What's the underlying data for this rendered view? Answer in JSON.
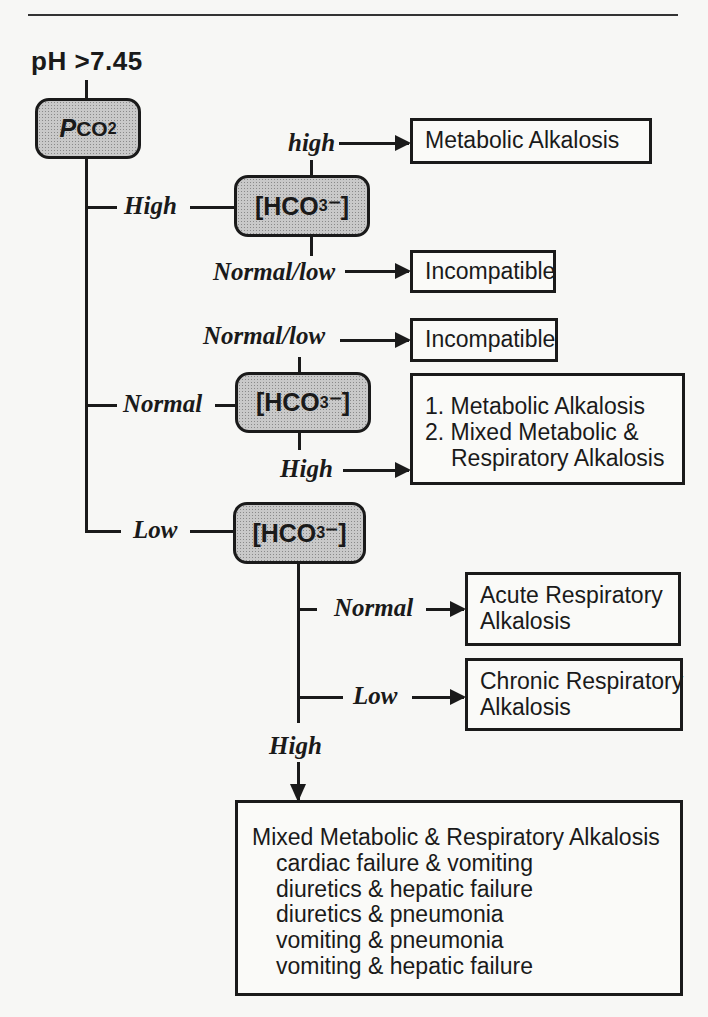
{
  "title": {
    "ph": "pH",
    "threshold": ">7.45"
  },
  "root_node": {
    "label": "P",
    "label_rest": "CO",
    "sub": "2"
  },
  "hco3_node": {
    "label": "[HCO",
    "sub": "3",
    "suffix": "⁻]"
  },
  "branches": {
    "high": {
      "label": "High",
      "sub_high": {
        "label": "high",
        "result": "Metabolic  Alkalosis"
      },
      "sub_normal_low": {
        "label": "Normal/low",
        "result": "Incompatible"
      }
    },
    "normal": {
      "label": "Normal",
      "sub_normal_low": {
        "label": "Normal/low",
        "result": "Incompatible"
      },
      "sub_high": {
        "label": "High",
        "results": [
          "1.  Metabolic  Alkalosis",
          "2.  Mixed  Metabolic  &",
          "Respiratory  Alkalosis"
        ]
      }
    },
    "low": {
      "label": "Low",
      "sub_normal": {
        "label": "Normal",
        "results": [
          "Acute  Respiratory",
          "Alkalosis"
        ]
      },
      "sub_low": {
        "label": "Low",
        "results": [
          "Chronic  Respiratory",
          "Alkalosis"
        ]
      },
      "sub_high": {
        "label": "High",
        "heading": "Mixed  Metabolic  &  Respiratory  Alkalosis",
        "causes": [
          "cardiac  failure  &  vomiting",
          "diuretics  &  hepatic  failure",
          "diuretics  &  pneumonia",
          "vomiting  &  pneumonia",
          "vomiting  &  hepatic  failure"
        ]
      }
    }
  }
}
